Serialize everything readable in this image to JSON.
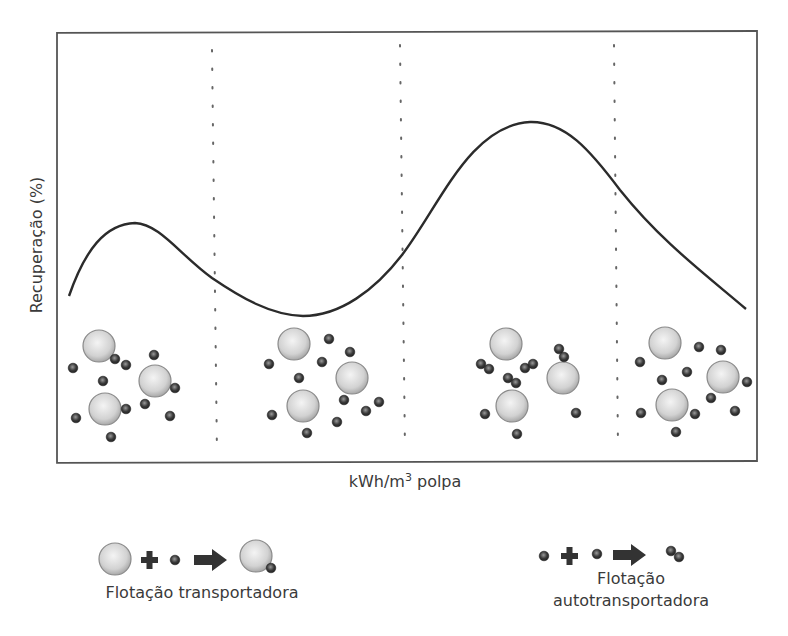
{
  "diagram": {
    "y_axis_label": "Recuperação (%)",
    "x_axis_label_prefix": "kWh/m",
    "x_axis_label_sup": "3",
    "x_axis_label_suffix": " polpa",
    "curve": {
      "description": "Recovery vs energy input: small peak, valley, large peak, then decline",
      "stroke": "#2b2b2b"
    },
    "regions": [
      {
        "name": "region-1",
        "description": "Large bubbles with dispersed fine particles, some attached"
      },
      {
        "name": "region-2",
        "description": "Large bubbles with dispersed fine particles"
      },
      {
        "name": "region-3",
        "description": "Fine particles aggregated in pairs (autogenous carrier)"
      },
      {
        "name": "region-4",
        "description": "Large bubbles with dispersed fine particles"
      }
    ],
    "colors": {
      "frame": "#555555",
      "divider": "#777777",
      "coarse_particle": "#d9d9d9",
      "fine_particle": "#3c3c3c"
    }
  },
  "legend": {
    "left": {
      "label": "Flotação transportadora",
      "equation": [
        "coarse-particle",
        "plus",
        "fine-particle",
        "arrow",
        "coarse-with-fine"
      ]
    },
    "right": {
      "label_line1": "Flotação",
      "label_line2": "autotransportadora",
      "equation": [
        "fine-particle",
        "plus",
        "fine-particle",
        "arrow",
        "fine-pair"
      ]
    }
  }
}
